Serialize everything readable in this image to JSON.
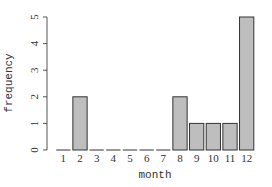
{
  "chart_data": {
    "type": "bar",
    "title": "",
    "xlabel": "month",
    "ylabel": "frequency",
    "categories": [
      "1",
      "2",
      "3",
      "4",
      "5",
      "6",
      "7",
      "8",
      "9",
      "10",
      "11",
      "12"
    ],
    "values": [
      0,
      2,
      0,
      0,
      0,
      0,
      0,
      2,
      1,
      1,
      1,
      5
    ],
    "ylim": [
      0,
      5
    ],
    "yticks": [
      0,
      1,
      2,
      3,
      4,
      5
    ],
    "grid": false,
    "legend": "none",
    "colors": {
      "bar_fill": "#bebebe",
      "bar_stroke": "#333333",
      "axis": "#555555"
    }
  }
}
